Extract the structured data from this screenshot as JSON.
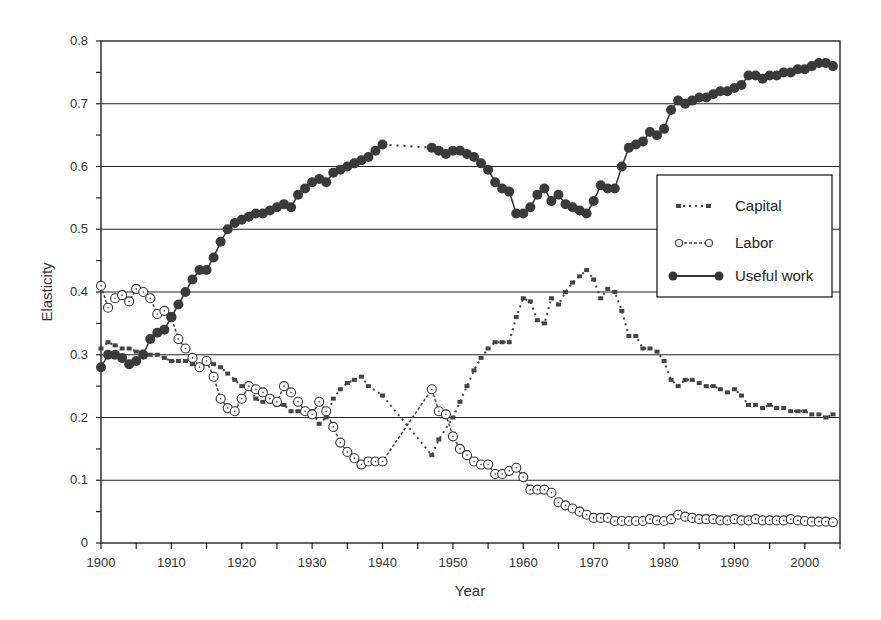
{
  "chart_data": {
    "type": "line",
    "title": "",
    "xlabel": "Year",
    "ylabel": "Elasticity",
    "xlim": [
      1900,
      2005
    ],
    "ylim": [
      0,
      0.8
    ],
    "x_ticks": [
      1900,
      1910,
      1920,
      1930,
      1940,
      1950,
      1960,
      1970,
      1980,
      1990,
      2000
    ],
    "y_ticks": [
      "0",
      "0.1",
      "0.2",
      "0.3",
      "0.4",
      "0.5",
      "0.6",
      "0.7",
      "0.8"
    ],
    "grid": "horizontal",
    "legend_position": "right-center",
    "series": [
      {
        "name": "Capital",
        "style": "dash-dot, small square markers",
        "x": [
          1900,
          1901,
          1902,
          1903,
          1904,
          1905,
          1906,
          1907,
          1908,
          1909,
          1910,
          1911,
          1912,
          1913,
          1914,
          1915,
          1916,
          1917,
          1918,
          1919,
          1920,
          1921,
          1922,
          1923,
          1924,
          1925,
          1926,
          1927,
          1928,
          1929,
          1930,
          1931,
          1932,
          1933,
          1934,
          1935,
          1936,
          1937,
          1938,
          1940,
          1947,
          1948,
          1950,
          1951,
          1952,
          1953,
          1954,
          1955,
          1956,
          1957,
          1958,
          1959,
          1960,
          1961,
          1962,
          1963,
          1964,
          1965,
          1966,
          1967,
          1968,
          1969,
          1970,
          1971,
          1972,
          1973,
          1974,
          1975,
          1976,
          1977,
          1978,
          1979,
          1980,
          1981,
          1982,
          1983,
          1984,
          1985,
          1986,
          1987,
          1988,
          1989,
          1990,
          1991,
          1992,
          1993,
          1994,
          1995,
          1996,
          1997,
          1998,
          1999,
          2000,
          2001,
          2002,
          2003,
          2004
        ],
        "values": [
          0.31,
          0.32,
          0.315,
          0.31,
          0.31,
          0.305,
          0.305,
          0.3,
          0.3,
          0.295,
          0.29,
          0.29,
          0.29,
          0.285,
          0.28,
          0.285,
          0.285,
          0.28,
          0.27,
          0.26,
          0.25,
          0.25,
          0.23,
          0.225,
          0.225,
          0.22,
          0.22,
          0.21,
          0.21,
          0.21,
          0.21,
          0.19,
          0.2,
          0.23,
          0.245,
          0.255,
          0.26,
          0.265,
          0.25,
          0.235,
          0.14,
          0.165,
          0.2,
          0.225,
          0.25,
          0.275,
          0.295,
          0.31,
          0.32,
          0.32,
          0.32,
          0.36,
          0.39,
          0.385,
          0.355,
          0.35,
          0.39,
          0.38,
          0.4,
          0.415,
          0.425,
          0.435,
          0.42,
          0.39,
          0.405,
          0.4,
          0.37,
          0.33,
          0.33,
          0.31,
          0.31,
          0.305,
          0.29,
          0.26,
          0.25,
          0.26,
          0.26,
          0.255,
          0.25,
          0.25,
          0.245,
          0.24,
          0.245,
          0.235,
          0.22,
          0.22,
          0.215,
          0.22,
          0.215,
          0.215,
          0.21,
          0.21,
          0.21,
          0.205,
          0.205,
          0.2,
          0.205
        ]
      },
      {
        "name": "Labor",
        "style": "dashed, open circle markers",
        "x": [
          1900,
          1901,
          1902,
          1903,
          1904,
          1905,
          1906,
          1907,
          1908,
          1909,
          1910,
          1911,
          1912,
          1913,
          1914,
          1915,
          1916,
          1917,
          1918,
          1919,
          1920,
          1921,
          1922,
          1923,
          1924,
          1925,
          1926,
          1927,
          1928,
          1929,
          1930,
          1931,
          1932,
          1933,
          1934,
          1935,
          1936,
          1937,
          1938,
          1939,
          1940,
          1947,
          1948,
          1949,
          1950,
          1951,
          1952,
          1953,
          1954,
          1955,
          1956,
          1957,
          1958,
          1959,
          1960,
          1961,
          1962,
          1963,
          1964,
          1965,
          1966,
          1967,
          1968,
          1969,
          1970,
          1971,
          1972,
          1973,
          1974,
          1975,
          1976,
          1977,
          1978,
          1979,
          1980,
          1981,
          1982,
          1983,
          1984,
          1985,
          1986,
          1987,
          1988,
          1989,
          1990,
          1991,
          1992,
          1993,
          1994,
          1995,
          1996,
          1997,
          1998,
          1999,
          2000,
          2001,
          2002,
          2003,
          2004
        ],
        "values": [
          0.41,
          0.375,
          0.39,
          0.395,
          0.385,
          0.405,
          0.4,
          0.39,
          0.365,
          0.37,
          0.36,
          0.325,
          0.31,
          0.295,
          0.28,
          0.29,
          0.265,
          0.23,
          0.215,
          0.21,
          0.23,
          0.25,
          0.245,
          0.24,
          0.23,
          0.225,
          0.25,
          0.24,
          0.225,
          0.21,
          0.205,
          0.225,
          0.21,
          0.185,
          0.16,
          0.145,
          0.135,
          0.125,
          0.13,
          0.13,
          0.13,
          0.245,
          0.21,
          0.205,
          0.17,
          0.15,
          0.14,
          0.13,
          0.125,
          0.125,
          0.11,
          0.11,
          0.115,
          0.12,
          0.105,
          0.085,
          0.085,
          0.085,
          0.08,
          0.065,
          0.06,
          0.055,
          0.05,
          0.045,
          0.04,
          0.04,
          0.04,
          0.035,
          0.035,
          0.035,
          0.035,
          0.035,
          0.038,
          0.036,
          0.035,
          0.038,
          0.045,
          0.042,
          0.04,
          0.038,
          0.038,
          0.038,
          0.036,
          0.036,
          0.038,
          0.036,
          0.036,
          0.038,
          0.036,
          0.036,
          0.036,
          0.036,
          0.038,
          0.036,
          0.035,
          0.034,
          0.034,
          0.034,
          0.033
        ]
      },
      {
        "name": "Useful work",
        "style": "solid, filled circle markers",
        "x": [
          1900,
          1901,
          1902,
          1903,
          1904,
          1905,
          1906,
          1907,
          1908,
          1909,
          1910,
          1911,
          1912,
          1913,
          1914,
          1915,
          1916,
          1917,
          1918,
          1919,
          1920,
          1921,
          1922,
          1923,
          1924,
          1925,
          1926,
          1927,
          1928,
          1929,
          1930,
          1931,
          1932,
          1933,
          1934,
          1935,
          1936,
          1937,
          1938,
          1939,
          1940,
          1947,
          1948,
          1949,
          1950,
          1951,
          1952,
          1953,
          1954,
          1955,
          1956,
          1957,
          1958,
          1959,
          1960,
          1961,
          1962,
          1963,
          1964,
          1965,
          1966,
          1967,
          1968,
          1969,
          1970,
          1971,
          1972,
          1973,
          1974,
          1975,
          1976,
          1977,
          1978,
          1979,
          1980,
          1981,
          1982,
          1983,
          1984,
          1985,
          1986,
          1987,
          1988,
          1989,
          1990,
          1991,
          1992,
          1993,
          1994,
          1995,
          1996,
          1997,
          1998,
          1999,
          2000,
          2001,
          2002,
          2003,
          2004
        ],
        "values": [
          0.28,
          0.3,
          0.3,
          0.295,
          0.285,
          0.29,
          0.3,
          0.325,
          0.335,
          0.34,
          0.36,
          0.38,
          0.4,
          0.42,
          0.435,
          0.435,
          0.455,
          0.48,
          0.5,
          0.51,
          0.515,
          0.52,
          0.525,
          0.525,
          0.53,
          0.535,
          0.54,
          0.535,
          0.555,
          0.565,
          0.575,
          0.58,
          0.575,
          0.59,
          0.595,
          0.6,
          0.605,
          0.61,
          0.615,
          0.625,
          0.635,
          0.63,
          0.625,
          0.62,
          0.625,
          0.625,
          0.62,
          0.615,
          0.605,
          0.595,
          0.575,
          0.565,
          0.56,
          0.525,
          0.525,
          0.535,
          0.555,
          0.565,
          0.545,
          0.555,
          0.54,
          0.535,
          0.53,
          0.525,
          0.545,
          0.57,
          0.565,
          0.565,
          0.6,
          0.63,
          0.635,
          0.64,
          0.655,
          0.65,
          0.66,
          0.69,
          0.705,
          0.7,
          0.705,
          0.71,
          0.71,
          0.715,
          0.72,
          0.72,
          0.725,
          0.73,
          0.745,
          0.745,
          0.74,
          0.745,
          0.745,
          0.75,
          0.75,
          0.755,
          0.755,
          0.76,
          0.765,
          0.765,
          0.76
        ]
      }
    ]
  }
}
